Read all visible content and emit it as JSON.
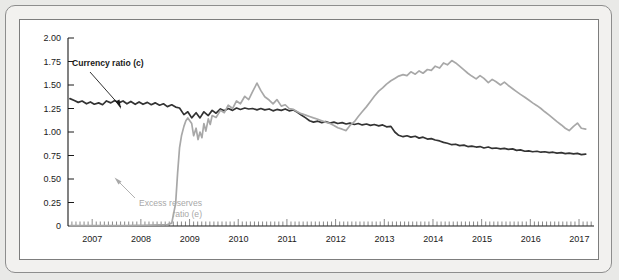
{
  "figure": {
    "background_color": "#f2f1ef",
    "plot_background": "#ffffff",
    "frame_color": "#8d8d8d"
  },
  "annotations": {
    "currency": {
      "label": "Currency ratio (c)",
      "color": "#1a1a1a"
    },
    "excess": {
      "label_line1": "Excess reserves",
      "label_line2": "ratio (e)",
      "color": "#a8a8a8"
    }
  },
  "chart_data": {
    "type": "line",
    "title": "",
    "xlabel": "",
    "ylabel": "",
    "xlim": [
      2006.5,
      2017.3
    ],
    "ylim": [
      0,
      2.0
    ],
    "grid": false,
    "legend": "annotated-inline",
    "ytick_labels": [
      "0",
      "0.25",
      "0.50",
      "0.75",
      "1.00",
      "1.25",
      "1.50",
      "1.75",
      "2.00"
    ],
    "ytick_values": [
      0,
      0.25,
      0.5,
      0.75,
      1.0,
      1.25,
      1.5,
      1.75,
      2.0
    ],
    "xtick_labels": [
      "2007",
      "2008",
      "2009",
      "2010",
      "2011",
      "2012",
      "2013",
      "2014",
      "2015",
      "2016",
      "2017"
    ],
    "xtick_values": [
      2007,
      2008,
      2009,
      2010,
      2011,
      2012,
      2013,
      2014,
      2015,
      2016,
      2017
    ],
    "minor_tick_interval_years": 0.0833,
    "series": [
      {
        "name": "Currency ratio (c)",
        "color": "#333333",
        "width": 1.7,
        "x": [
          2006.54,
          2006.63,
          2006.71,
          2006.79,
          2006.88,
          2006.96,
          2007.04,
          2007.13,
          2007.21,
          2007.29,
          2007.38,
          2007.46,
          2007.54,
          2007.63,
          2007.71,
          2007.79,
          2007.88,
          2007.96,
          2008.04,
          2008.13,
          2008.21,
          2008.29,
          2008.38,
          2008.46,
          2008.54,
          2008.63,
          2008.71,
          2008.79,
          2008.88,
          2008.96,
          2009.04,
          2009.13,
          2009.21,
          2009.29,
          2009.38,
          2009.46,
          2009.54,
          2009.63,
          2009.71,
          2009.79,
          2009.88,
          2009.96,
          2010.04,
          2010.13,
          2010.21,
          2010.29,
          2010.38,
          2010.46,
          2010.54,
          2010.63,
          2010.71,
          2010.79,
          2010.88,
          2010.96,
          2011.04,
          2011.13,
          2011.21,
          2011.29,
          2011.38,
          2011.46,
          2011.54,
          2011.63,
          2011.71,
          2011.79,
          2011.88,
          2011.96,
          2012.04,
          2012.13,
          2012.21,
          2012.29,
          2012.38,
          2012.46,
          2012.54,
          2012.63,
          2012.71,
          2012.79,
          2012.88,
          2012.96,
          2013.04,
          2013.13,
          2013.21,
          2013.29,
          2013.38,
          2013.46,
          2013.54,
          2013.63,
          2013.71,
          2013.79,
          2013.88,
          2013.96,
          2014.04,
          2014.13,
          2014.21,
          2014.29,
          2014.38,
          2014.46,
          2014.54,
          2014.63,
          2014.71,
          2014.79,
          2014.88,
          2014.96,
          2015.04,
          2015.13,
          2015.21,
          2015.29,
          2015.38,
          2015.46,
          2015.54,
          2015.63,
          2015.71,
          2015.79,
          2015.88,
          2015.96,
          2016.04,
          2016.13,
          2016.21,
          2016.29,
          2016.38,
          2016.46,
          2016.54,
          2016.63,
          2016.71,
          2016.79,
          2016.88,
          2016.96,
          2017.04,
          2017.13
        ],
        "y": [
          1.355,
          1.335,
          1.315,
          1.33,
          1.3,
          1.32,
          1.295,
          1.31,
          1.29,
          1.33,
          1.31,
          1.335,
          1.31,
          1.33,
          1.3,
          1.325,
          1.295,
          1.32,
          1.295,
          1.315,
          1.29,
          1.31,
          1.285,
          1.3,
          1.27,
          1.29,
          1.265,
          1.255,
          1.185,
          1.215,
          1.15,
          1.205,
          1.15,
          1.215,
          1.175,
          1.23,
          1.2,
          1.245,
          1.225,
          1.25,
          1.23,
          1.255,
          1.24,
          1.255,
          1.245,
          1.25,
          1.235,
          1.25,
          1.235,
          1.245,
          1.225,
          1.24,
          1.23,
          1.245,
          1.225,
          1.235,
          1.21,
          1.18,
          1.15,
          1.12,
          1.105,
          1.115,
          1.1,
          1.11,
          1.095,
          1.105,
          1.09,
          1.1,
          1.085,
          1.095,
          1.08,
          1.09,
          1.075,
          1.085,
          1.07,
          1.08,
          1.065,
          1.075,
          1.055,
          1.06,
          1.0,
          0.965,
          0.95,
          0.96,
          0.945,
          0.955,
          0.935,
          0.945,
          0.925,
          0.93,
          0.915,
          0.905,
          0.89,
          0.88,
          0.865,
          0.87,
          0.855,
          0.86,
          0.845,
          0.85,
          0.84,
          0.845,
          0.83,
          0.84,
          0.825,
          0.83,
          0.82,
          0.825,
          0.815,
          0.82,
          0.805,
          0.81,
          0.795,
          0.8,
          0.79,
          0.795,
          0.785,
          0.79,
          0.78,
          0.785,
          0.775,
          0.78,
          0.77,
          0.775,
          0.768,
          0.772,
          0.76,
          0.765
        ]
      },
      {
        "name": "Excess reserves ratio (e)",
        "color": "#a8a8a8",
        "width": 1.7,
        "x": [
          2006.54,
          2006.71,
          2006.88,
          2007.04,
          2007.21,
          2007.38,
          2007.54,
          2007.71,
          2007.88,
          2008.04,
          2008.21,
          2008.38,
          2008.54,
          2008.63,
          2008.71,
          2008.75,
          2008.79,
          2008.83,
          2008.88,
          2008.92,
          2008.96,
          2009.04,
          2009.08,
          2009.13,
          2009.17,
          2009.21,
          2009.25,
          2009.29,
          2009.33,
          2009.38,
          2009.42,
          2009.46,
          2009.54,
          2009.63,
          2009.71,
          2009.79,
          2009.88,
          2009.96,
          2010.04,
          2010.13,
          2010.21,
          2010.29,
          2010.38,
          2010.46,
          2010.54,
          2010.63,
          2010.71,
          2010.79,
          2010.88,
          2010.96,
          2011.04,
          2011.13,
          2011.21,
          2011.29,
          2011.38,
          2011.46,
          2011.54,
          2011.63,
          2011.71,
          2011.79,
          2011.88,
          2011.96,
          2012.04,
          2012.13,
          2012.21,
          2012.29,
          2012.38,
          2012.46,
          2012.54,
          2012.63,
          2012.71,
          2012.79,
          2012.88,
          2012.96,
          2013.04,
          2013.13,
          2013.21,
          2013.29,
          2013.38,
          2013.46,
          2013.54,
          2013.63,
          2013.71,
          2013.79,
          2013.88,
          2013.96,
          2014.04,
          2014.13,
          2014.21,
          2014.29,
          2014.38,
          2014.46,
          2014.54,
          2014.63,
          2014.71,
          2014.79,
          2014.88,
          2014.96,
          2015.04,
          2015.13,
          2015.21,
          2015.29,
          2015.38,
          2015.46,
          2015.54,
          2015.63,
          2015.71,
          2015.79,
          2015.88,
          2015.96,
          2016.04,
          2016.13,
          2016.21,
          2016.29,
          2016.38,
          2016.46,
          2016.54,
          2016.63,
          2016.71,
          2016.79,
          2016.88,
          2016.96,
          2017.04,
          2017.13
        ],
        "y": [
          0.004,
          0.004,
          0.004,
          0.004,
          0.005,
          0.004,
          0.005,
          0.004,
          0.006,
          0.008,
          0.01,
          0.012,
          0.015,
          0.03,
          0.24,
          0.56,
          0.83,
          0.96,
          1.06,
          1.12,
          1.15,
          1.09,
          0.96,
          1.04,
          0.92,
          1.0,
          0.94,
          1.09,
          1.01,
          1.14,
          1.08,
          1.175,
          1.155,
          1.23,
          1.205,
          1.285,
          1.25,
          1.33,
          1.3,
          1.38,
          1.345,
          1.43,
          1.52,
          1.44,
          1.375,
          1.34,
          1.3,
          1.345,
          1.275,
          1.29,
          1.25,
          1.24,
          1.215,
          1.195,
          1.18,
          1.165,
          1.15,
          1.135,
          1.12,
          1.105,
          1.09,
          1.07,
          1.045,
          1.03,
          1.015,
          1.07,
          1.11,
          1.165,
          1.215,
          1.27,
          1.325,
          1.38,
          1.435,
          1.47,
          1.51,
          1.545,
          1.57,
          1.595,
          1.61,
          1.6,
          1.64,
          1.615,
          1.65,
          1.625,
          1.665,
          1.655,
          1.7,
          1.68,
          1.735,
          1.715,
          1.76,
          1.735,
          1.7,
          1.66,
          1.625,
          1.595,
          1.565,
          1.6,
          1.57,
          1.525,
          1.56,
          1.535,
          1.5,
          1.53,
          1.495,
          1.46,
          1.43,
          1.4,
          1.37,
          1.34,
          1.31,
          1.28,
          1.25,
          1.215,
          1.18,
          1.145,
          1.11,
          1.075,
          1.04,
          1.015,
          1.06,
          1.095,
          1.04,
          1.03
        ]
      }
    ]
  }
}
